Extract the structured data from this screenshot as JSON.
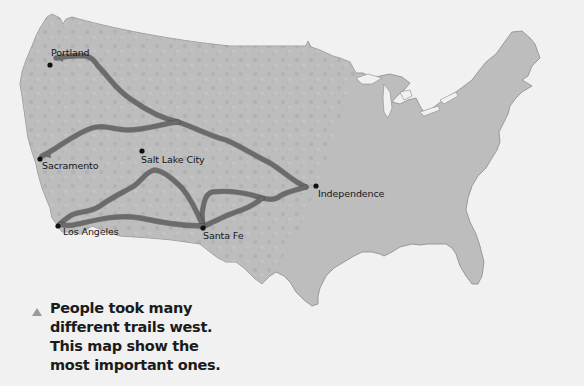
{
  "map": {
    "title": "Trails West",
    "region": "United States",
    "colors": {
      "background": "#f1f1f1",
      "land": "#bdbdbd",
      "trail": "#6b6b6b",
      "city_marker": "#111111"
    },
    "cities": [
      {
        "id": "portland",
        "label": "Portland"
      },
      {
        "id": "sacramento",
        "label": "Sacramento"
      },
      {
        "id": "salt-lake-city",
        "label": "Salt Lake City"
      },
      {
        "id": "los-angeles",
        "label": "Los Angeles"
      },
      {
        "id": "santa-fe",
        "label": "Santa Fe"
      },
      {
        "id": "independence",
        "label": "Independence"
      }
    ],
    "trails": [
      {
        "id": "oregon-trail",
        "from": "Independence",
        "to": "Portland"
      },
      {
        "id": "california-trail",
        "from": "Independence",
        "to": "Sacramento"
      },
      {
        "id": "santa-fe-trail",
        "from": "Independence",
        "to": "Santa Fe"
      },
      {
        "id": "old-spanish-trail",
        "from": "Santa Fe",
        "to": "Los Angeles"
      },
      {
        "id": "gila-trail",
        "from": "Santa Fe",
        "to": "Los Angeles"
      }
    ]
  },
  "caption": {
    "bullet_icon": "triangle-up-icon",
    "text": "People took many different trails west. This map show the most important ones."
  }
}
